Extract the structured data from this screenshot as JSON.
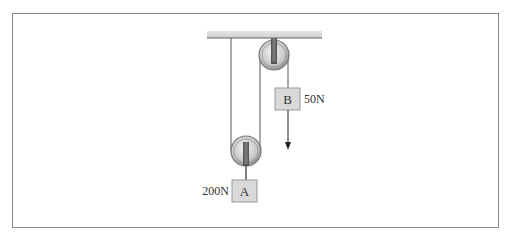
{
  "diagram": {
    "type": "pulley-system",
    "blocks": [
      {
        "id": "A",
        "label": "A",
        "weight": "200N"
      },
      {
        "id": "B",
        "label": "B",
        "weight": "50N"
      }
    ],
    "pulleys": [
      {
        "name": "fixed-pulley",
        "attached_to": "ceiling"
      },
      {
        "name": "movable-pulley",
        "attached_to": "block A"
      }
    ]
  },
  "colors": {
    "frame": "#8a8a8a",
    "ceiling": "#d4d4d4",
    "block_fill": "#d9d9d9",
    "rope": "#555555"
  }
}
